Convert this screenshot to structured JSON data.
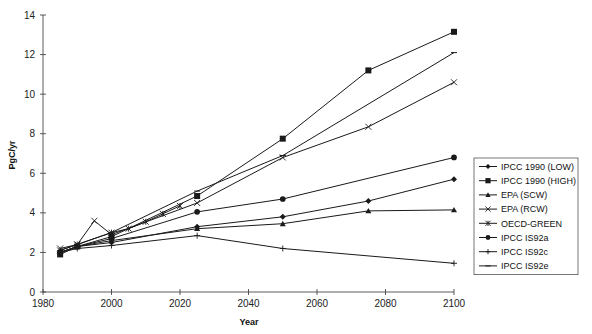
{
  "chart_data": {
    "type": "line",
    "title": "",
    "xlabel": "Year",
    "ylabel": "PgC/yr",
    "xlim": [
      1980,
      2100
    ],
    "ylim": [
      0,
      14
    ],
    "xticks": [
      1980,
      2000,
      2020,
      2040,
      2060,
      2080,
      2100
    ],
    "yticks": [
      0,
      2,
      4,
      6,
      8,
      10,
      12,
      14
    ],
    "grid": false,
    "legend_position": "right",
    "series": [
      {
        "name": "IPCC 1990 (LOW)",
        "marker": "diamond",
        "x": [
          1985,
          1990,
          2000,
          2025,
          2050,
          2075,
          2100
        ],
        "values": [
          2.0,
          2.3,
          2.5,
          3.3,
          3.8,
          4.6,
          5.7
        ]
      },
      {
        "name": "IPCC 1990 (HIGH)",
        "marker": "square",
        "x": [
          1985,
          1990,
          2000,
          2025,
          2050,
          2075,
          2100
        ],
        "values": [
          1.9,
          2.3,
          2.8,
          4.85,
          7.75,
          11.2,
          13.15
        ]
      },
      {
        "name": "EPA (SCW)",
        "marker": "triangle",
        "x": [
          1985,
          1990,
          2000,
          2025,
          2050,
          2075,
          2100
        ],
        "values": [
          2.0,
          2.3,
          2.6,
          3.2,
          3.45,
          4.1,
          4.15
        ]
      },
      {
        "name": "EPA (RCW)",
        "marker": "x",
        "x": [
          1985,
          1990,
          1995,
          2000,
          2025,
          2050,
          2075,
          2100
        ],
        "values": [
          2.2,
          2.4,
          3.6,
          2.9,
          4.5,
          6.8,
          8.35,
          10.6
        ]
      },
      {
        "name": "OECD-GREEN",
        "marker": "asterisk",
        "x": [
          1985,
          1990,
          2000,
          2005,
          2010,
          2015,
          2020
        ],
        "values": [
          2.1,
          2.4,
          3.0,
          3.2,
          3.55,
          3.95,
          4.35
        ]
      },
      {
        "name": "IPCC IS92a",
        "marker": "circle",
        "x": [
          1985,
          1990,
          2000,
          2025,
          2050,
          2100
        ],
        "values": [
          2.0,
          2.3,
          2.7,
          4.05,
          4.7,
          6.8
        ]
      },
      {
        "name": "IPCC IS92c",
        "marker": "plus",
        "x": [
          1985,
          1990,
          2000,
          2025,
          2050,
          2100
        ],
        "values": [
          2.0,
          2.2,
          2.35,
          2.85,
          2.2,
          1.45
        ]
      },
      {
        "name": "IPCC IS92e",
        "marker": "dash",
        "x": [
          1985,
          1990,
          2000,
          2025,
          2050,
          2100
        ],
        "values": [
          2.1,
          2.4,
          3.0,
          5.1,
          6.9,
          12.1
        ]
      }
    ]
  },
  "colors": {
    "line": "#1a1a1a",
    "axis": "#333333",
    "legend_border": "#555555",
    "background": "#ffffff"
  }
}
